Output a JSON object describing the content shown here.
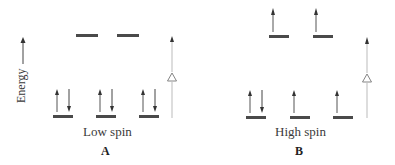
{
  "axis": {
    "label": "Energy",
    "icon": "up-arrow-icon"
  },
  "delta_symbol": "△",
  "colors": {
    "level": "#4a4a4a",
    "arrow": "#555555",
    "split_line": "#bbbbbb",
    "text": "#333333"
  },
  "panels": [
    {
      "id": "A",
      "spin_label": "Low spin",
      "caption": "A",
      "upper_levels": [
        {
          "electrons": []
        },
        {
          "electrons": []
        }
      ],
      "lower_levels": [
        {
          "electrons": [
            "up",
            "down"
          ]
        },
        {
          "electrons": [
            "up",
            "down"
          ]
        },
        {
          "electrons": [
            "up",
            "down"
          ]
        }
      ]
    },
    {
      "id": "B",
      "spin_label": "High spin",
      "caption": "B",
      "upper_levels": [
        {
          "electrons": [
            "up"
          ]
        },
        {
          "electrons": [
            "up"
          ]
        }
      ],
      "lower_levels": [
        {
          "electrons": [
            "up",
            "down"
          ]
        },
        {
          "electrons": [
            "up"
          ]
        },
        {
          "electrons": [
            "up"
          ]
        }
      ]
    }
  ]
}
